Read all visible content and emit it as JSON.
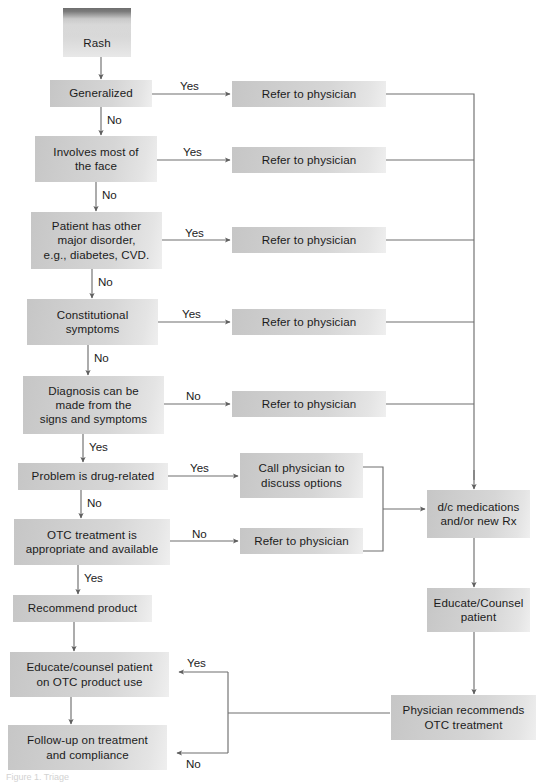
{
  "colors": {
    "box_fill_light": "#e6e6e6",
    "box_fill_dark": "#c6c6c6",
    "start_band": "#6e6e6e",
    "line": "#6f6f6f",
    "text": "#1b1b1b",
    "background": "#ffffff"
  },
  "caption": "Figure 1.  Triage",
  "nodes": {
    "rash": "Rash",
    "generalized": "Generalized",
    "involves_face": "Involves most of\nthe face",
    "other_disorder": "Patient has other\nmajor disorder,\ne.g., diabetes, CVD.",
    "constitutional": "Constitutional\nsymptoms",
    "diagnosis": "Diagnosis can be\nmade from the\nsigns and symptoms",
    "drug_related": "Problem is drug-related",
    "otc_appropriate": "OTC treatment is\nappropriate and available",
    "recommend_product": "Recommend product",
    "educate_otc": "Educate/counsel patient\non OTC product use",
    "follow_up": "Follow-up on treatment\nand compliance",
    "refer_1": "Refer to physician",
    "refer_2": "Refer to physician",
    "refer_3": "Refer to physician",
    "refer_4": "Refer to physician",
    "refer_5": "Refer to physician",
    "call_physician": "Call physician to\ndiscuss options",
    "refer_6": "Refer to physician",
    "dc_medications": "d/c medications\nand/or new Rx",
    "educate_counsel": "Educate/Counsel\npatient",
    "physician_otc": "Physician recommends\nOTC treatment"
  },
  "edge_labels": {
    "generalized_yes": "Yes",
    "generalized_no": "No",
    "face_yes": "Yes",
    "face_no": "No",
    "disorder_yes": "Yes",
    "disorder_no": "No",
    "constitutional_yes": "Yes",
    "constitutional_no": "No",
    "diagnosis_no": "No",
    "diagnosis_yes": "Yes",
    "drug_yes": "Yes",
    "drug_no": "No",
    "otc_no": "No",
    "otc_yes": "Yes",
    "return_yes": "Yes",
    "return_no": "No"
  }
}
